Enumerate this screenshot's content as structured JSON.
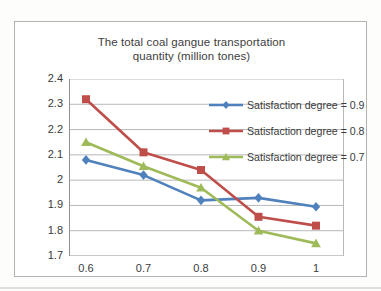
{
  "chart_data": {
    "type": "line",
    "title": "The total coal gangue transportation quantity (million tones)",
    "title_lines": [
      "The total coal gangue transportation",
      "quantity (million tones)"
    ],
    "x": [
      0.6,
      0.7,
      0.8,
      0.9,
      1
    ],
    "x_tick_labels": [
      "0.6",
      "0.7",
      "0.8",
      "0.9",
      "1"
    ],
    "y_ticks": [
      2.4,
      2.3,
      2.2,
      2.1,
      2.0,
      1.9,
      1.8,
      1.7
    ],
    "y_tick_labels": [
      "2.4",
      "2.3",
      "2.2",
      "2.1",
      "2",
      "1.9",
      "1.8",
      "1.7"
    ],
    "xlim": [
      0.6,
      1.0
    ],
    "ylim": [
      1.7,
      2.4
    ],
    "grid": "horizontal",
    "legend_position": "upper-right-inside",
    "series": [
      {
        "name": "Satisfaction degree = 0.9",
        "marker": "diamond",
        "color": "#4f81bd",
        "values": [
          2.08,
          2.02,
          1.92,
          1.93,
          1.895
        ]
      },
      {
        "name": "Satisfaction degree = 0.8",
        "marker": "square",
        "color": "#bf4e4b",
        "values": [
          2.32,
          2.11,
          2.04,
          1.855,
          1.82
        ]
      },
      {
        "name": "Satisfaction degree = 0.7",
        "marker": "triangle",
        "color": "#9fba58",
        "values": [
          2.15,
          2.055,
          1.97,
          1.8,
          1.75
        ]
      }
    ],
    "style_colors": {
      "gridline": "#b8b8b8",
      "axis": "#8f8f8f",
      "frame_border": "#b2b2b2",
      "text": "#3a3a3a",
      "plot_background": "#ffffff"
    }
  }
}
